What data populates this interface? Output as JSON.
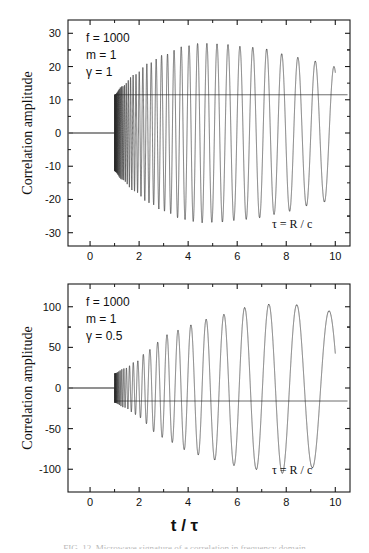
{
  "figure": {
    "xlabel": "t / τ",
    "ylabel": "Correlation amplitude",
    "caption": "FIG. 12. Microwave signature of a correlation in frequency domain"
  },
  "panels": [
    {
      "id": "top",
      "annotations": {
        "f": "f = 1000",
        "m": "m = 1",
        "gamma": "γ = 1",
        "tau": "τ = R / c"
      },
      "yticks": [
        "30",
        "20",
        "10",
        "0",
        "-10",
        "-20",
        "-30"
      ],
      "xticks": [
        "0",
        "2",
        "4",
        "6",
        "8",
        "10"
      ]
    },
    {
      "id": "bottom",
      "annotations": {
        "f": "f = 1000",
        "m": "m = 1",
        "gamma": "γ = 0.5",
        "tau": "τ = R / c"
      },
      "yticks": [
        "100",
        "50",
        "0",
        "-50",
        "-100"
      ],
      "xticks": [
        "0",
        "2",
        "4",
        "6",
        "8",
        "10"
      ]
    }
  ],
  "chart_data": [
    {
      "type": "line",
      "title": "",
      "xlabel": "t / τ",
      "ylabel": "Correlation amplitude",
      "xlim": [
        -0.9,
        10.6
      ],
      "ylim": [
        -34,
        34
      ],
      "xticks": [
        0,
        2,
        4,
        6,
        8,
        10
      ],
      "yticks": [
        -30,
        -20,
        -10,
        0,
        10,
        20,
        30
      ],
      "grid": false,
      "legend": null,
      "annotations": [
        "f = 1000",
        "m = 1",
        "γ = 1",
        "τ = R / c"
      ],
      "series": [
        {
          "name": "correlation",
          "comment": "chirped oscillation: zero for t<1, then modulated envelope growing to ~27 and decaying slightly",
          "model": "chirp",
          "t_start": 1.0,
          "t_end": 10.0,
          "phase_const": 1000,
          "gamma": 1,
          "m": 1,
          "amplitude_peak": 27,
          "envelope_points": [
            {
              "t": 1.0,
              "amp": 11.5
            },
            {
              "t": 1.3,
              "amp": 14.0
            },
            {
              "t": 1.8,
              "amp": 17.5
            },
            {
              "t": 2.4,
              "amp": 21.0
            },
            {
              "t": 3.0,
              "amp": 23.5
            },
            {
              "t": 3.8,
              "amp": 26.0
            },
            {
              "t": 4.5,
              "amp": 27.0
            },
            {
              "t": 5.3,
              "amp": 26.8
            },
            {
              "t": 6.3,
              "amp": 26.0
            },
            {
              "t": 7.0,
              "amp": 25.5
            },
            {
              "t": 7.9,
              "amp": 23.8
            },
            {
              "t": 9.0,
              "amp": 21.8
            },
            {
              "t": 10.0,
              "amp": 20.0
            }
          ],
          "visible_peaks": [
            {
              "t": 3.85,
              "y": 25.5
            },
            {
              "t": 4.5,
              "y": 27.0
            },
            {
              "t": 5.3,
              "y": 27.0
            },
            {
              "t": 6.3,
              "y": 26.0
            },
            {
              "t": 7.95,
              "y": 23.8
            }
          ],
          "visible_troughs": [
            {
              "t": 4.15,
              "y": -26.5
            },
            {
              "t": 5.8,
              "y": -26.8
            },
            {
              "t": 7.0,
              "y": -25.5
            },
            {
              "t": 9.0,
              "y": -21.8
            }
          ]
        },
        {
          "name": "reference-line-zero",
          "comment": "flat segment at y=0 for t from -0.9 to 1.0",
          "values": [
            0,
            0
          ],
          "x": [
            -0.9,
            1.0
          ]
        },
        {
          "name": "reference-line-mean",
          "comment": "horizontal grey line across the full panel",
          "y": 11.5,
          "x": [
            1.0,
            10.5
          ]
        }
      ]
    },
    {
      "type": "line",
      "title": "",
      "xlabel": "t / τ",
      "ylabel": "Correlation amplitude",
      "xlim": [
        -0.9,
        10.6
      ],
      "ylim": [
        -128,
        128
      ],
      "xticks": [
        0,
        2,
        4,
        6,
        8,
        10
      ],
      "yticks": [
        -100,
        -50,
        0,
        50,
        100
      ],
      "grid": false,
      "legend": null,
      "annotations": [
        "f = 1000",
        "m = 1",
        "γ = 0.5",
        "τ = R / c"
      ],
      "series": [
        {
          "name": "correlation",
          "comment": "chirped oscillation with slower chirp (gamma=0.5): amplitude grows monotonically to ~105",
          "model": "chirp",
          "t_start": 1.0,
          "t_end": 10.0,
          "phase_const": 1000,
          "gamma": 0.5,
          "m": 1,
          "amplitude_peak": 105,
          "envelope_points": [
            {
              "t": 1.0,
              "amp": 18.0
            },
            {
              "t": 1.4,
              "amp": 24.0
            },
            {
              "t": 1.9,
              "amp": 33.0
            },
            {
              "t": 2.3,
              "amp": 44.0
            },
            {
              "t": 2.7,
              "amp": 56.0
            },
            {
              "t": 3.2,
              "amp": 66.0
            },
            {
              "t": 4.0,
              "amp": 77.0
            },
            {
              "t": 4.6,
              "amp": 84.0
            },
            {
              "t": 5.3,
              "amp": 90.0
            },
            {
              "t": 6.3,
              "amp": 99.0
            },
            {
              "t": 7.9,
              "amp": 105.0
            },
            {
              "t": 9.2,
              "amp": 98.0
            },
            {
              "t": 10.0,
              "amp": 94.0
            }
          ],
          "visible_peaks": [
            {
              "t": 2.7,
              "y": 58.0
            },
            {
              "t": 3.2,
              "y": 66.0
            },
            {
              "t": 4.0,
              "y": 77.0
            },
            {
              "t": 5.3,
              "y": 90.0
            },
            {
              "t": 7.9,
              "y": 105.0
            }
          ],
          "visible_troughs": [
            {
              "t": 3.05,
              "y": -63.0
            },
            {
              "t": 3.6,
              "y": -72.0
            },
            {
              "t": 4.55,
              "y": -85.0
            },
            {
              "t": 6.3,
              "y": -99.0
            },
            {
              "t": 10.0,
              "y": -94.0
            }
          ]
        },
        {
          "name": "reference-line-zero",
          "comment": "flat segment at y=0 for t from -0.9 to 1.0",
          "values": [
            0,
            0
          ],
          "x": [
            -0.9,
            1.0
          ]
        },
        {
          "name": "reference-line-mean",
          "comment": "horizontal grey line across the full panel",
          "y": -16.0,
          "x": [
            1.0,
            10.5
          ]
        }
      ]
    }
  ],
  "style": {
    "axis_color": "#1a1a1a",
    "curve_color": "#2b2b2b",
    "reference_line_color": "#6d6d6d",
    "background": "#ffffff",
    "text_color": "#111111"
  }
}
